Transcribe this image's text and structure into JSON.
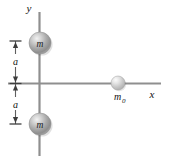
{
  "figure": {
    "background_color": "#ffffff",
    "width": 169,
    "height": 165
  },
  "axes": {
    "y_axis_label": "y",
    "x_axis_label": "x",
    "axis_color": "#8c8c8c",
    "origin": {
      "x": 39,
      "y": 83
    }
  },
  "bodies": [
    {
      "id": "mass-top",
      "label": "m",
      "subscript": "",
      "cx": 40,
      "cy": 43,
      "r": 11,
      "fill": "#a8a8a8",
      "highlight": "#e4e4e4"
    },
    {
      "id": "mass-bottom",
      "label": "m",
      "subscript": "",
      "cx": 40,
      "cy": 124,
      "r": 11,
      "fill": "#a8a8a8",
      "highlight": "#e4e4e4"
    },
    {
      "id": "mass-test",
      "label": "m",
      "subscript": "0",
      "cx": 118,
      "cy": 83,
      "r": 7,
      "fill": "#c9c9c9",
      "highlight": "#f0f0f0"
    }
  ],
  "dimensions": [
    {
      "id": "dim-upper",
      "label": "a",
      "from_y": 41,
      "to_y": 83,
      "x": 15
    },
    {
      "id": "dim-lower",
      "label": "a",
      "from_y": 83,
      "to_y": 124,
      "x": 15
    }
  ],
  "labels": {
    "mass_top": "m",
    "mass_bottom": "m",
    "mass_test": "m",
    "mass_test_subscript": "0",
    "dim_upper": "a",
    "dim_lower": "a",
    "axis_y": "y",
    "axis_x": "x"
  }
}
